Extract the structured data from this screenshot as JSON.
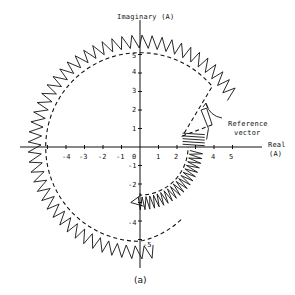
{
  "chart_data": {
    "type": "scatter",
    "title": "",
    "caption": "(a)",
    "xlabel": "Real (A)",
    "ylabel": "Imaginary (A)",
    "xlim": [
      -5.5,
      5.5
    ],
    "ylim": [
      -5.5,
      5.5
    ],
    "x_ticks": [
      -4,
      -3,
      -2,
      -1,
      0,
      1,
      2,
      3,
      4,
      5
    ],
    "y_ticks": [
      5,
      4,
      3,
      2,
      1,
      -1,
      -2,
      -4,
      -5
    ],
    "grid": false,
    "legend": null,
    "annotations": [
      {
        "text": "Reference vector",
        "points_to": [
          3.2,
          1.4
        ]
      }
    ],
    "series": [
      {
        "name": "reference circle (dashed)",
        "style": "dashed",
        "description": "circular locus of radius ~5.1 A from ~10 deg counter-clockwise round to ~-40 deg, then spiralling inward to radius ~2.5 A",
        "start_radius": 5.1,
        "end_radius": 2.6
      },
      {
        "name": "current trajectory (zigzag)",
        "style": "solid zigzag",
        "description": "sawtooth current vector trajectory oscillating outside the dashed reference locus, radius ~5.4-6.0 A, ending near (2.2, -3) and (3.3, 0)",
        "inner_radius": 5.2,
        "outer_radius": 6.0
      }
    ]
  },
  "axes": {
    "x_label_line1": "Real",
    "x_label_line2": "(A)",
    "y_label": "Imaginary (A)",
    "x_ticks": [
      "-4",
      "-3",
      "-2",
      "-1",
      "0",
      "1",
      "2",
      "4",
      "5"
    ],
    "y_ticks_pos": [
      "5",
      "4",
      "3",
      "2",
      "1"
    ],
    "y_ticks_neg": [
      "-1",
      "-2",
      "-4",
      "-5"
    ]
  },
  "annotation": {
    "line1": "Reference",
    "line2": "vector"
  },
  "caption": "(a)"
}
